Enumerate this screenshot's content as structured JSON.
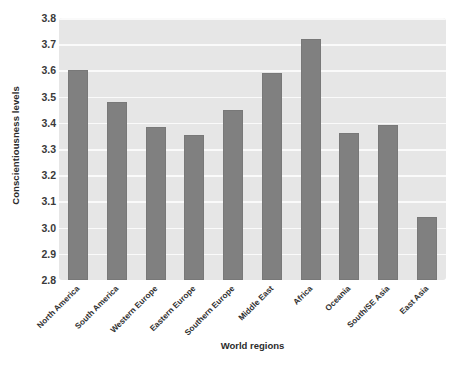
{
  "chart_data": {
    "type": "bar",
    "title": "",
    "xlabel": "World regions",
    "ylabel": "Conscientiousness levels",
    "categories": [
      "North America",
      "South America",
      "Western Europe",
      "Eastern Europe",
      "Southern Europe",
      "Middle East",
      "Africa",
      "Oceania",
      "South/SE Asia",
      "East Asia"
    ],
    "values": [
      3.6,
      3.48,
      3.385,
      3.355,
      3.45,
      3.59,
      3.72,
      3.36,
      3.39,
      3.04
    ],
    "ylim": [
      2.8,
      3.8
    ],
    "yticks": [
      "3.8",
      "3.7",
      "3.6",
      "3.5",
      "3.4",
      "3.3",
      "3.2",
      "3.1",
      "3.0",
      "2.9",
      "2.8"
    ],
    "ytick_values": [
      3.8,
      3.7,
      3.6,
      3.5,
      3.4,
      3.3,
      3.2,
      3.1,
      3.0,
      2.9,
      2.8
    ],
    "grid": true,
    "legend": false,
    "colors": {
      "bar": "#808080",
      "bar_border": "#787878",
      "plot_background": "#e6e6e6",
      "gridline": "#fafafa",
      "page_background": "#ffffff",
      "text": "#2b2b2b"
    }
  }
}
